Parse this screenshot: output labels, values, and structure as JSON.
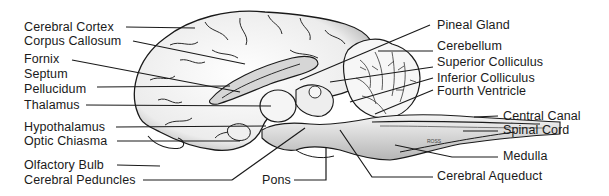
{
  "diagram": {
    "colors": {
      "ink": "#1a1a1a",
      "fill": "#f2f2f2",
      "shade": "#9a9a9a"
    },
    "labels_left": [
      {
        "id": "cerebral-cortex",
        "text": "Cerebral Cortex"
      },
      {
        "id": "corpus-callosum",
        "text": "Corpus Callosum"
      },
      {
        "id": "fornix",
        "text": "Fornix"
      },
      {
        "id": "septum",
        "text": "Septum"
      },
      {
        "id": "pellucidum",
        "text": "Pellucidum"
      },
      {
        "id": "thalamus",
        "text": "Thalamus"
      },
      {
        "id": "hypothalamus",
        "text": "Hypothalamus"
      },
      {
        "id": "optic-chiasma",
        "text": "Optic Chiasma"
      },
      {
        "id": "olfactory-bulb",
        "text": "Olfactory Bulb"
      },
      {
        "id": "cerebral-peduncles",
        "text": "Cerebral Peduncles"
      }
    ],
    "labels_right": [
      {
        "id": "pineal-gland",
        "text": "Pineal Gland"
      },
      {
        "id": "cerebellum",
        "text": "Cerebellum"
      },
      {
        "id": "superior-colliculus",
        "text": "Superior Colliculus"
      },
      {
        "id": "inferior-colliculus",
        "text": "Inferior Colliculus"
      },
      {
        "id": "fourth-ventricle",
        "text": "Fourth Ventricle"
      },
      {
        "id": "central-canal",
        "text": "Central Canal"
      },
      {
        "id": "spinal-cord",
        "text": "Spinal Cord"
      },
      {
        "id": "medulla",
        "text": "Medulla"
      },
      {
        "id": "cerebral-aqueduct",
        "text": "Cerebral Aqueduct"
      }
    ],
    "labels_bottom": [
      {
        "id": "pons",
        "text": "Pons"
      }
    ],
    "signature": "ROSS"
  }
}
